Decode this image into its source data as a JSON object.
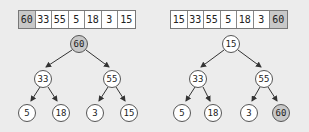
{
  "left": {
    "array": [
      "60",
      "33",
      "55",
      "5",
      "18",
      "3",
      "15"
    ],
    "highlight_index": 0,
    "tree": {
      "root": "60",
      "level1": [
        "33",
        "55"
      ],
      "level2": [
        "5",
        "18",
        "3",
        "15"
      ],
      "highlight": "root"
    }
  },
  "right": {
    "array": [
      "15",
      "33",
      "55",
      "5",
      "18",
      "3",
      "60"
    ],
    "highlight_index": 6,
    "tree": {
      "root": "15",
      "level1": [
        "33",
        "55"
      ],
      "level2": [
        "5",
        "18",
        "3",
        "60"
      ],
      "highlight": "last-leaf"
    }
  },
  "colors": {
    "highlight": "#c8c8c8",
    "node_fill": "#ffffff",
    "background": "#ececec"
  }
}
